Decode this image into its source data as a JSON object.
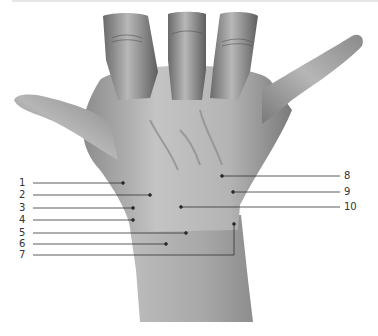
{
  "figure": {
    "line_color": "#333333",
    "skin_colors": {
      "light": "#d4d4d4",
      "mid": "#a9a9a9",
      "dark": "#6e6e6e"
    }
  },
  "labels": {
    "left": [
      {
        "num": "1",
        "y": 183,
        "end_x": 123,
        "end_y": 183
      },
      {
        "num": "2",
        "y": 195,
        "end_x": 150,
        "end_y": 195
      },
      {
        "num": "3",
        "y": 208,
        "end_x": 133,
        "end_y": 208
      },
      {
        "num": "4",
        "y": 220,
        "end_x": 133,
        "end_y": 220
      },
      {
        "num": "5",
        "y": 233,
        "end_x": 186,
        "end_y": 233
      },
      {
        "num": "6",
        "y": 244,
        "end_x": 166,
        "end_y": 244
      },
      {
        "num": "7",
        "y": 255,
        "end_x": 234,
        "end_y": 224
      }
    ],
    "right": [
      {
        "num": "8",
        "y": 176,
        "end_x": 222,
        "end_y": 176
      },
      {
        "num": "9",
        "y": 192,
        "end_x": 233,
        "end_y": 192
      },
      {
        "num": "10",
        "y": 207,
        "end_x": 181,
        "end_y": 207
      }
    ]
  }
}
